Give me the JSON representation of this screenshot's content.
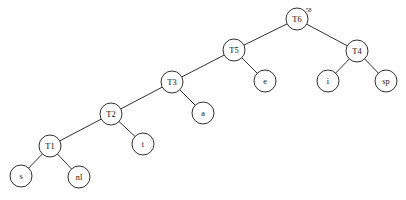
{
  "diagram": {
    "type": "binary-tree",
    "width": 406,
    "height": 200,
    "background_color": "#ffffff",
    "stroke_color": "#1a1a1a",
    "node_fill_color": "#ffffff",
    "node_radius": 11,
    "root_id": "T6",
    "nodes": [
      {
        "id": "T6",
        "label": "T6",
        "superscript": "58",
        "kind": "internal",
        "cx": 297,
        "cy": 19,
        "r": 11
      },
      {
        "id": "T5",
        "label": "T5",
        "superscript": "",
        "kind": "internal",
        "cx": 234,
        "cy": 50,
        "r": 11
      },
      {
        "id": "T4",
        "label": "T4",
        "superscript": "",
        "kind": "internal",
        "cx": 357,
        "cy": 51,
        "r": 11
      },
      {
        "id": "T3",
        "label": "T3",
        "superscript": "",
        "kind": "internal",
        "cx": 172,
        "cy": 82,
        "r": 11
      },
      {
        "id": "T2",
        "label": "T2",
        "superscript": "",
        "kind": "internal",
        "cx": 111,
        "cy": 114,
        "r": 11
      },
      {
        "id": "T1",
        "label": "T1",
        "superscript": "",
        "kind": "internal",
        "cx": 50,
        "cy": 146,
        "r": 11
      },
      {
        "id": "e",
        "label": "e",
        "superscript": "",
        "kind": "leaf",
        "cx": 265,
        "cy": 81,
        "r": 11
      },
      {
        "id": "i",
        "label": "i",
        "superscript": "",
        "kind": "leaf",
        "cx": 328,
        "cy": 81,
        "r": 11
      },
      {
        "id": "sp",
        "label": "sp",
        "superscript": "",
        "kind": "leaf",
        "cx": 386,
        "cy": 81,
        "r": 11
      },
      {
        "id": "a",
        "label": "a",
        "superscript": "",
        "kind": "leaf",
        "cx": 203,
        "cy": 113,
        "r": 11
      },
      {
        "id": "t",
        "label": "t",
        "superscript": "",
        "kind": "leaf",
        "cx": 143,
        "cy": 144,
        "r": 11
      },
      {
        "id": "s",
        "label": "s",
        "superscript": "",
        "kind": "leaf",
        "cx": 21,
        "cy": 176,
        "r": 11
      },
      {
        "id": "nl",
        "label": "nl",
        "superscript": "",
        "kind": "leaf",
        "cx": 79,
        "cy": 177,
        "r": 11
      }
    ],
    "edges": [
      {
        "from": "T6",
        "to": "T5",
        "side": "left"
      },
      {
        "from": "T6",
        "to": "T4",
        "side": "right"
      },
      {
        "from": "T5",
        "to": "T3",
        "side": "left"
      },
      {
        "from": "T5",
        "to": "e",
        "side": "right"
      },
      {
        "from": "T4",
        "to": "i",
        "side": "left"
      },
      {
        "from": "T4",
        "to": "sp",
        "side": "right"
      },
      {
        "from": "T3",
        "to": "T2",
        "side": "left"
      },
      {
        "from": "T3",
        "to": "a",
        "side": "right"
      },
      {
        "from": "T2",
        "to": "T1",
        "side": "left"
      },
      {
        "from": "T2",
        "to": "t",
        "side": "right"
      },
      {
        "from": "T1",
        "to": "s",
        "side": "left"
      },
      {
        "from": "T1",
        "to": "nl",
        "side": "right"
      }
    ],
    "caption": ""
  }
}
